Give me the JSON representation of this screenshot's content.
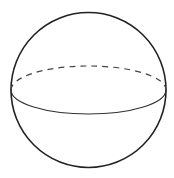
{
  "diagram": {
    "type": "sphere",
    "stroke_color": "#222222",
    "background": "#ffffff",
    "outline": {
      "cx": 88.5,
      "cy": 90,
      "r": 77.5
    },
    "equator": {
      "cx": 88.5,
      "cy": 90,
      "rx": 77.5,
      "ry": 24,
      "front": "solid",
      "back": "dashed"
    }
  }
}
